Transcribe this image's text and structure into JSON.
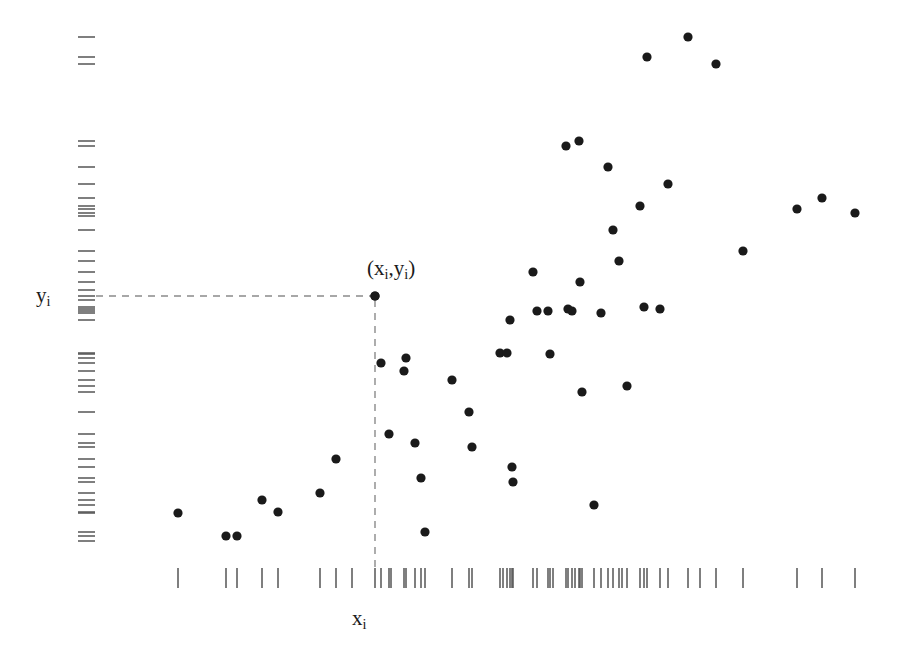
{
  "figure": {
    "type": "scatter-with-rug",
    "background_color": "#ffffff",
    "point_color": "#1a1a1a",
    "rug_color": "#555555",
    "dashed_color": "#8a8a8a",
    "width": 897,
    "height": 660
  },
  "labels": {
    "y_axis": {
      "base": "y",
      "sub": "i"
    },
    "x_axis": {
      "base": "x",
      "sub": "i"
    },
    "point_annotation": {
      "open_paren": "(",
      "x_base": "x",
      "x_sub": "i",
      "comma": ",",
      "y_base": "y",
      "y_sub": "i",
      "close_paren": ")"
    }
  },
  "highlighted_point": {
    "label": "(x_i,y_i)",
    "px": 375,
    "py": 296
  },
  "guides": {
    "horizontal_dashed": {
      "x1": 96,
      "y1": 296,
      "x2": 372,
      "y2": 296
    },
    "vertical_dashed": {
      "x1": 375,
      "y1": 300,
      "x2": 375,
      "y2": 572
    }
  },
  "chart_data": {
    "type": "scatter",
    "title": "",
    "xlabel": "x_i",
    "ylabel": "y_i",
    "grid": false,
    "legend": "none",
    "axis_ticks_shown": false,
    "xlim_px": [
      150,
      880
    ],
    "ylim_px": [
      30,
      560
    ],
    "note": "Pixel coordinates of plotted markers; origin top-left of a 897x660 canvas. Y increases downward in pixels, so smaller py means larger data value.",
    "points_px": [
      [
        178,
        513
      ],
      [
        226,
        536
      ],
      [
        237,
        536
      ],
      [
        262,
        500
      ],
      [
        278,
        512
      ],
      [
        320,
        493
      ],
      [
        336,
        459
      ],
      [
        375,
        296
      ],
      [
        381,
        363
      ],
      [
        389,
        434
      ],
      [
        404,
        371
      ],
      [
        406,
        358
      ],
      [
        415,
        443
      ],
      [
        421,
        478
      ],
      [
        425,
        532
      ],
      [
        452,
        380
      ],
      [
        469,
        412
      ],
      [
        472,
        447
      ],
      [
        500,
        353
      ],
      [
        507,
        353
      ],
      [
        512,
        467
      ],
      [
        513,
        482
      ],
      [
        510,
        320
      ],
      [
        533,
        272
      ],
      [
        537,
        311
      ],
      [
        548,
        311
      ],
      [
        550,
        354
      ],
      [
        566,
        146
      ],
      [
        568,
        309
      ],
      [
        572,
        311
      ],
      [
        579,
        141
      ],
      [
        580,
        282
      ],
      [
        582,
        392
      ],
      [
        594,
        505
      ],
      [
        601,
        313
      ],
      [
        608,
        167
      ],
      [
        613,
        230
      ],
      [
        619,
        261
      ],
      [
        627,
        386
      ],
      [
        640,
        206
      ],
      [
        644,
        307
      ],
      [
        647,
        57
      ],
      [
        660,
        309
      ],
      [
        668,
        184
      ],
      [
        688,
        37
      ],
      [
        716,
        64
      ],
      [
        743,
        251
      ],
      [
        797,
        209
      ],
      [
        822,
        198
      ],
      [
        855,
        213
      ]
    ],
    "x_rug_px": [
      178,
      226,
      237,
      262,
      278,
      320,
      336,
      352,
      375,
      381,
      389,
      391,
      404,
      406,
      415,
      421,
      425,
      452,
      469,
      472,
      500,
      503,
      507,
      510,
      512,
      513,
      533,
      537,
      548,
      550,
      553,
      566,
      568,
      572,
      575,
      579,
      580,
      582,
      594,
      601,
      608,
      613,
      619,
      622,
      627,
      640,
      644,
      647,
      660,
      668,
      688,
      700,
      716,
      743,
      797,
      822,
      855
    ],
    "y_rug_px": [
      37,
      57,
      64,
      141,
      146,
      167,
      184,
      198,
      206,
      209,
      213,
      216,
      230,
      251,
      261,
      272,
      282,
      290,
      296,
      300,
      307,
      309,
      311,
      313,
      320,
      353,
      354,
      358,
      363,
      371,
      380,
      386,
      392,
      412,
      434,
      443,
      447,
      459,
      467,
      478,
      482,
      493,
      500,
      505,
      512,
      513,
      532,
      536,
      541
    ]
  }
}
